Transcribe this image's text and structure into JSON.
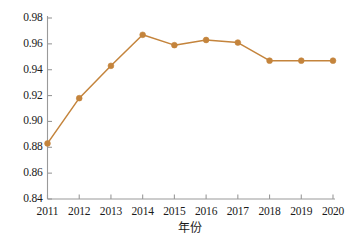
{
  "chart_data": {
    "type": "line",
    "title": "",
    "subtitle": "",
    "xlabel": "年份",
    "ylabel": "",
    "categories": [
      "2011",
      "2012",
      "2013",
      "2014",
      "2015",
      "2016",
      "2017",
      "2018",
      "2019",
      "2020"
    ],
    "x": [
      2011,
      2012,
      2013,
      2014,
      2015,
      2016,
      2017,
      2018,
      2019,
      2020
    ],
    "values": [
      0.883,
      0.918,
      0.943,
      0.967,
      0.959,
      0.963,
      0.961,
      0.947,
      0.947,
      0.947
    ],
    "series": [
      {
        "name": "",
        "values": [
          0.883,
          0.918,
          0.943,
          0.967,
          0.959,
          0.963,
          0.961,
          0.947,
          0.947,
          0.947
        ]
      }
    ],
    "ylim": [
      0.84,
      0.98
    ],
    "xlim": [
      2011,
      2020
    ],
    "ytick_labels": [
      "0.98",
      "0.96",
      "0.94",
      "0.92",
      "0.90",
      "0.88",
      "0.86",
      "0.84"
    ],
    "ytick_values": [
      0.98,
      0.96,
      0.94,
      0.92,
      0.9,
      0.88,
      0.86,
      0.84
    ],
    "xtick_labels": [
      "2011",
      "2012",
      "2013",
      "2014",
      "2015",
      "2016",
      "2017",
      "2018",
      "2019",
      "2020"
    ],
    "grid": false,
    "legend": false,
    "legend_position": "none",
    "annotations": [],
    "marker": "circle",
    "line_color": "#c4843c",
    "marker_color": "#c4843c",
    "axis_color": "#9a9a9a",
    "text_color": "#1a1a1a"
  },
  "axis": {
    "y_labels": [
      "0.98",
      "0.96",
      "0.94",
      "0.92",
      "0.90",
      "0.88",
      "0.86",
      "0.84"
    ],
    "x_labels": [
      "2011",
      "2012",
      "2013",
      "2014",
      "2015",
      "2016",
      "2017",
      "2018",
      "2019",
      "2020"
    ],
    "x_title": "年份"
  }
}
